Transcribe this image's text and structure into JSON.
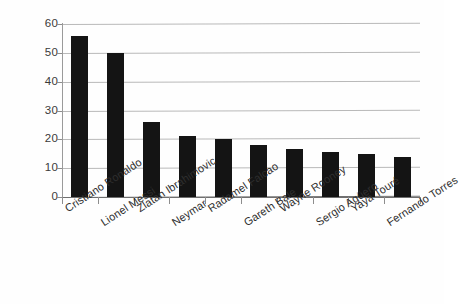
{
  "chart_data": {
    "type": "bar",
    "title": "",
    "subtitle": "",
    "xlabel": "",
    "ylabel": "",
    "ylim": [
      0,
      60
    ],
    "ytick_labels": [
      "0",
      "10",
      "20",
      "30",
      "40",
      "50",
      "60"
    ],
    "ytick_values": [
      0,
      10,
      20,
      30,
      40,
      50,
      60
    ],
    "grid": "horizontal",
    "legend": "none",
    "bar_color": "#141414",
    "gridline_color": "#b9b9b9",
    "axis_color": "#6f6f6f",
    "categories": [
      "Cristiano Ronaldo",
      "Lionel Messi",
      "Zlatan Ibrahimovic",
      "Neymar",
      "Radamel Falcao",
      "Gareth Bale",
      "Wayne Rooney",
      "Sergio Agüero",
      "Yaya Touré",
      "Fernando Torres"
    ],
    "values": [
      56,
      50,
      26,
      21,
      20,
      18,
      16.5,
      15.5,
      15,
      14
    ]
  }
}
